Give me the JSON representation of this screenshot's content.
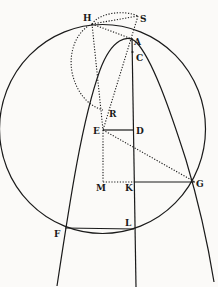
{
  "figure": {
    "type": "geometric-diagram",
    "labels": {
      "H": "H",
      "S": "S",
      "A": "A",
      "C": "C",
      "R": "R",
      "E": "E",
      "D": "D",
      "M": "M",
      "K": "K",
      "G": "G",
      "L": "L",
      "F": "F"
    },
    "colors": {
      "ink": "#1a1a1a",
      "paper": "#fbfaf8"
    }
  }
}
